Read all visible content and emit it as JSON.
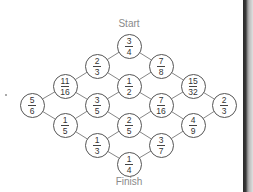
{
  "diagram": {
    "start_label": "Start",
    "finish_label": "Finish",
    "colors": {
      "line": "#777777",
      "circle_border": "#555555",
      "text": "#333333",
      "label": "#8a8a8a",
      "right_edge": "#2a2a2a"
    },
    "grid": {
      "col_x": [
        32,
        65,
        97,
        129,
        161,
        193,
        224
      ],
      "row_y": [
        46,
        66,
        86,
        105,
        125,
        145,
        164
      ]
    },
    "nodes": [
      {
        "id": "n_3_4",
        "col": 3,
        "row": 0,
        "num": "3",
        "den": "4"
      },
      {
        "id": "n_2_3a",
        "col": 2,
        "row": 1,
        "num": "2",
        "den": "3"
      },
      {
        "id": "n_7_8",
        "col": 4,
        "row": 1,
        "num": "7",
        "den": "8"
      },
      {
        "id": "n_11_16",
        "col": 1,
        "row": 2,
        "num": "11",
        "den": "16"
      },
      {
        "id": "n_1_2",
        "col": 3,
        "row": 2,
        "num": "1",
        "den": "2"
      },
      {
        "id": "n_15_32",
        "col": 5,
        "row": 2,
        "num": "15",
        "den": "32"
      },
      {
        "id": "n_5_6",
        "col": 0,
        "row": 3,
        "num": "5",
        "den": "6"
      },
      {
        "id": "n_3_5",
        "col": 2,
        "row": 3,
        "num": "3",
        "den": "5"
      },
      {
        "id": "n_7_16",
        "col": 4,
        "row": 3,
        "num": "7",
        "den": "16"
      },
      {
        "id": "n_2_3b",
        "col": 6,
        "row": 3,
        "num": "2",
        "den": "3"
      },
      {
        "id": "n_1_5",
        "col": 1,
        "row": 4,
        "num": "1",
        "den": "5"
      },
      {
        "id": "n_2_5",
        "col": 3,
        "row": 4,
        "num": "2",
        "den": "5"
      },
      {
        "id": "n_4_9",
        "col": 5,
        "row": 4,
        "num": "4",
        "den": "9"
      },
      {
        "id": "n_1_3",
        "col": 2,
        "row": 5,
        "num": "1",
        "den": "3"
      },
      {
        "id": "n_3_7",
        "col": 4,
        "row": 5,
        "num": "3",
        "den": "7"
      },
      {
        "id": "n_1_4",
        "col": 3,
        "row": 6,
        "num": "1",
        "den": "4"
      }
    ]
  }
}
